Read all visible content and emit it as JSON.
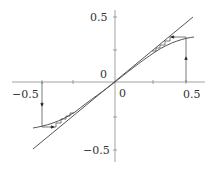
{
  "diagram": {
    "type": "cobweb-plot",
    "axes": {
      "x_ticks": [
        "-0.5",
        "0",
        "0.5"
      ],
      "y_ticks": [
        "0.5",
        "0",
        "-0.5"
      ],
      "origin_x_label": "0",
      "origin_y_label": "0"
    },
    "curves": [
      {
        "name": "identity-line",
        "equation": "y = x"
      },
      {
        "name": "map-curve",
        "description": "S-shaped curve through origin"
      }
    ],
    "cobwebs": [
      {
        "start_x": 0.45,
        "direction": "up"
      },
      {
        "start_x": -0.45,
        "direction": "down"
      }
    ],
    "colors": {
      "line": "#555555",
      "axis": "#888888"
    }
  },
  "labels": {
    "x_neg": "−0.5",
    "x_pos": "0.5",
    "x_zero": "0",
    "y_pos": "0.5",
    "y_neg": "−0.5",
    "y_zero": "0"
  }
}
